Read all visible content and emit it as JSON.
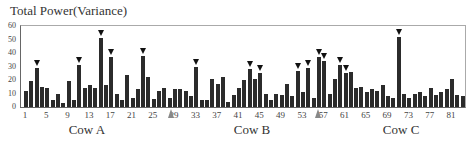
{
  "chart_data": {
    "type": "bar",
    "title": "Total Power(Variance)",
    "xlabel": "",
    "ylabel": "Total Power(Variance)",
    "ylim": [
      0,
      60
    ],
    "yticks": [
      0,
      10,
      20,
      30,
      40,
      50,
      60
    ],
    "xtick_labels": [
      "1",
      "5",
      "9",
      "13",
      "17",
      "21",
      "25",
      "29",
      "33",
      "37",
      "41",
      "45",
      "49",
      "53",
      "57",
      "61",
      "65",
      "69",
      "73",
      "77",
      "81"
    ],
    "groups": [
      {
        "name": "Cow A",
        "center_index": 13
      },
      {
        "name": "Cow B",
        "center_index": 44
      },
      {
        "name": "Cow C",
        "center_index": 72
      }
    ],
    "values": [
      12,
      19,
      29,
      15,
      14,
      5,
      10,
      3,
      19,
      5,
      31,
      14,
      16,
      14,
      51,
      16,
      37,
      10,
      5,
      24,
      7,
      13,
      38,
      22,
      6,
      12,
      14,
      7,
      13,
      13,
      12,
      8,
      30,
      5,
      5,
      21,
      17,
      22,
      4,
      9,
      14,
      20,
      28,
      21,
      25,
      10,
      5,
      10,
      9,
      17,
      8,
      27,
      11,
      29,
      7,
      37,
      34,
      10,
      21,
      31,
      25,
      26,
      14,
      15,
      11,
      13,
      12,
      16,
      8,
      7,
      52,
      10,
      7,
      10,
      11,
      8,
      14,
      9,
      11,
      13,
      21,
      9,
      8
    ],
    "marked_bars": [
      3,
      11,
      15,
      17,
      23,
      33,
      43,
      45,
      52,
      54,
      56,
      57,
      60,
      61,
      71
    ],
    "gray_markers": [
      29,
      56.5
    ],
    "bar_color": "#2b2b2b",
    "marker_color": "#111111",
    "gray_marker_color": "#888888",
    "grid": false
  }
}
